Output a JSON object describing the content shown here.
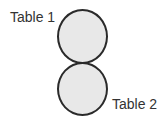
{
  "diagram": {
    "type": "table-layout",
    "tables": [
      {
        "label": "Table 1",
        "shape": "circle",
        "fill": "#e8e8e8",
        "stroke": "#2a2a2a"
      },
      {
        "label": "Table 2",
        "shape": "circle",
        "fill": "#e8e8e8",
        "stroke": "#2a2a2a"
      }
    ],
    "arrangement": "vertical, touching"
  }
}
